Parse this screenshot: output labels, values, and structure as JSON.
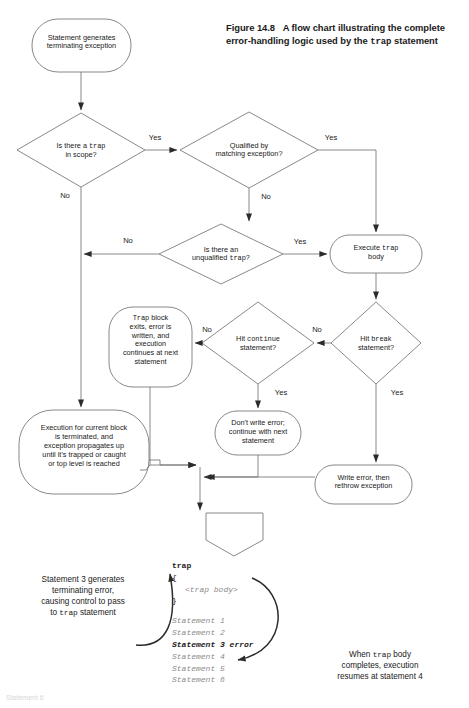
{
  "figure": {
    "caption_prefix": "Figure 14.8",
    "caption_line1": "A flow chart illustrating the complete",
    "caption_line2a": "error-handling logic used by the",
    "caption_keyword": "trap",
    "caption_line2b": "statement"
  },
  "colors": {
    "stroke": "#4a4a4a",
    "text": "#1a1a1a",
    "code_dim": "#8c8c8c",
    "background": "#ffffff"
  },
  "nodes": {
    "start": {
      "shape": "rounded-terminator",
      "line1": "Statement generates",
      "line2": "terminating exception"
    },
    "d_trap_scope": {
      "shape": "diamond",
      "line1_a": "Is there a",
      "line1_kw": "trap",
      "line2": "in scope?"
    },
    "d_qualified": {
      "shape": "diamond",
      "line1": "Qualified by",
      "line2": "matching exception?"
    },
    "d_unqualified": {
      "shape": "diamond",
      "line1": "Is there an",
      "line2_a": "unqualified",
      "line2_kw": "trap?"
    },
    "execute_trap": {
      "shape": "rounded-terminator",
      "line1_a": "Execute",
      "line1_kw": "trap",
      "line2": "body"
    },
    "d_continue": {
      "shape": "diamond",
      "line1_a": "Hit",
      "line1_kw": "continue",
      "line2": "statement?"
    },
    "d_break": {
      "shape": "diamond",
      "line1_a": "Hit",
      "line1_kw": "break",
      "line2": "statement?"
    },
    "trap_block_exits": {
      "shape": "rounded-terminator",
      "line1_kw": "Trap",
      "line1_a": "block",
      "line2": "exits, error is",
      "line3": "written, and",
      "line4": "execution",
      "line5": "continues at next",
      "line6": "statement"
    },
    "dont_write": {
      "shape": "rounded-terminator",
      "line1": "Don't write error;",
      "line2": "continue with next",
      "line3": "statement"
    },
    "write_rethrow": {
      "shape": "rounded-terminator",
      "line1": "Write error, then",
      "line2": "rethrow exception"
    },
    "execution_terminated": {
      "shape": "rounded-terminator",
      "line1": "Execution for current block",
      "line2": "is terminated, and",
      "line3": "exception propagates up",
      "line4": "until it's trapped or caught",
      "line5": "or top level is reached"
    },
    "end_marker": {
      "shape": "pentagon-down",
      "label": ""
    }
  },
  "edge_labels": {
    "trap_scope_yes": "Yes",
    "trap_scope_no": "No",
    "qualified_yes": "Yes",
    "qualified_no": "No",
    "unqualified_yes": "Yes",
    "unqualified_no": "No",
    "continue_no": "No",
    "continue_yes": "Yes",
    "break_no": "No",
    "break_yes": "Yes"
  },
  "code_sample": {
    "lines": [
      {
        "text": "trap",
        "style": "kw"
      },
      {
        "text": "{",
        "style": "brace"
      },
      {
        "text": "<trap body>",
        "style": "ital-ind"
      },
      {
        "text": "}",
        "style": "brace"
      },
      {
        "text": "",
        "style": "gap"
      },
      {
        "text": "Statement 1",
        "style": "ital"
      },
      {
        "text": "Statement 2",
        "style": "ital"
      },
      {
        "text": "Statement 3 error",
        "style": "hl"
      },
      {
        "text": "Statement 4",
        "style": "ital"
      },
      {
        "text": "Statement 5",
        "style": "ital"
      },
      {
        "text": "Statement 6",
        "style": "ital"
      }
    ],
    "highlight_line": "Statement 3 error"
  },
  "annotations": {
    "left": {
      "line1": "Statement 3 generates",
      "line2": "terminating error,",
      "line3": "causing control to pass",
      "line4_a": "to",
      "line4_kw": "trap",
      "line4_b": "statement"
    },
    "right": {
      "line1_a": "When",
      "line1_kw": "trap",
      "line1_b": "body",
      "line2": "completes, execution",
      "line3": "resumes at statement 4"
    }
  },
  "footer_ghost": "Statement 6"
}
